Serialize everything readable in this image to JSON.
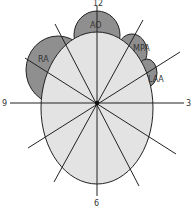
{
  "diagram": {
    "type": "clock-face heart cross-section",
    "colors": {
      "chamber_fill": "#8f8f8f",
      "ventricle_fill": "#e3e3e3",
      "stroke": "#222222",
      "background": "#ffffff"
    },
    "clock_labels": {
      "twelve": "12",
      "three": "3",
      "six": "6",
      "nine": "9"
    },
    "structure_labels": {
      "ao": "AO",
      "mpa": "MPA",
      "laa": "LAA",
      "ra": "RA"
    }
  }
}
